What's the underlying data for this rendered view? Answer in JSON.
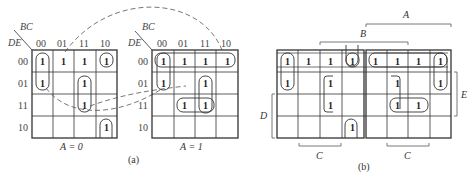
{
  "figure": {
    "part_a": {
      "label": "(a)",
      "row_var": "DE",
      "col_var": "BC",
      "col_labels": [
        "00",
        "01",
        "11",
        "10"
      ],
      "row_labels": [
        "00",
        "01",
        "11",
        "10"
      ],
      "maps": [
        {
          "caption": "A = 0",
          "cells": [
            [
              "1",
              "1",
              "1",
              "1"
            ],
            [
              "1",
              "",
              "1",
              ""
            ],
            [
              "",
              "",
              "1",
              ""
            ],
            [
              "",
              "",
              "",
              "1"
            ]
          ]
        },
        {
          "caption": "A = 1",
          "cells": [
            [
              "1",
              "1",
              "1",
              "1"
            ],
            [
              "1",
              "",
              "1",
              ""
            ],
            [
              "",
              "1",
              "1",
              ""
            ],
            [
              "",
              "",
              "",
              ""
            ]
          ]
        }
      ]
    },
    "part_b": {
      "label": "(b)",
      "brackets": {
        "A": "A",
        "B": "B",
        "C_left": "C",
        "C_right": "C",
        "D": "D",
        "E": "E"
      },
      "left_cells": [
        [
          "1",
          "1",
          "1",
          "1"
        ],
        [
          "1",
          "",
          "1",
          ""
        ],
        [
          "",
          "",
          "1",
          ""
        ],
        [
          "",
          "",
          "",
          "1"
        ]
      ],
      "right_cells": [
        [
          "1",
          "1",
          "1",
          "1"
        ],
        [
          "",
          "1",
          "",
          "1"
        ],
        [
          "",
          "1",
          "1",
          ""
        ],
        [
          "",
          "",
          "",
          ""
        ]
      ]
    }
  }
}
